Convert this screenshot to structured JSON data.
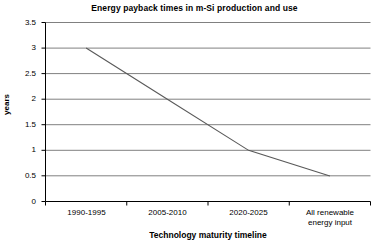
{
  "chart_data": {
    "type": "line",
    "title": "Energy payback times in m-Si production and use",
    "xlabel": "Technology maturity timeline",
    "ylabel": "years",
    "categories": [
      "1990-1995",
      "2005-2010",
      "2020-2025",
      "All renewable energy input"
    ],
    "category_lines": [
      [
        "1990-1995"
      ],
      [
        "2005-2010"
      ],
      [
        "2020-2025"
      ],
      [
        "All renewable",
        "energy input"
      ]
    ],
    "values": [
      3,
      2,
      1,
      0.5
    ],
    "ylim": [
      0,
      3.5
    ],
    "ytick_labels": [
      "3.5",
      "3",
      "2.5",
      "2",
      "1.5",
      "1",
      "0.5",
      "0"
    ],
    "ytick_values": [
      3.5,
      3,
      2.5,
      2,
      1.5,
      1,
      0.5,
      0
    ],
    "grid": "horizontal",
    "legend": "none",
    "line_color": "#595959",
    "axis_color": "#000000",
    "grid_color": "#808080",
    "background": "#ffffff"
  }
}
